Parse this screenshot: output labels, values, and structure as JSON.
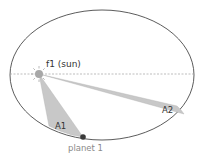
{
  "diagram": {
    "labels": {
      "focus": "f1 (sun)",
      "area1": "A1",
      "area2": "A2",
      "planet": "planet 1"
    },
    "colors": {
      "orbit": "#4a4a4a",
      "axis": "#a0a0a0",
      "sector_fill": "#c8c8c8",
      "sun": "#a8a8a8",
      "planet": "#3a3a3a",
      "label_dark": "#333333",
      "label_light": "#8a8a8a"
    }
  }
}
